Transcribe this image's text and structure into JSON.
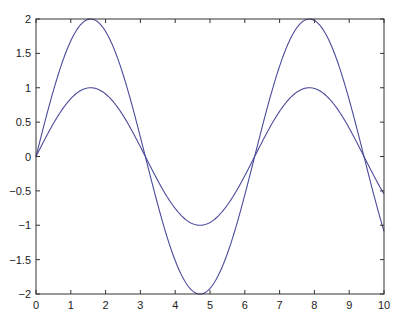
{
  "chart_data": {
    "type": "line",
    "title": "",
    "xlabel": "",
    "ylabel": "",
    "xlim": [
      0,
      10
    ],
    "ylim": [
      -2,
      2
    ],
    "grid": false,
    "legend": null,
    "x_ticks": [
      "0",
      "1",
      "2",
      "3",
      "4",
      "5",
      "6",
      "7",
      "8",
      "9",
      "10"
    ],
    "y_ticks": [
      "2",
      "1.5",
      "1",
      "0.5",
      "0",
      "-0.5",
      "-1",
      "-1.5",
      "-2"
    ],
    "line_color": "#4b4b9a",
    "series": [
      {
        "name": "sin(x)",
        "function": "sin",
        "amplitude": 1,
        "x": [
          0,
          0.5,
          1,
          1.5,
          2,
          2.5,
          3,
          3.5,
          4,
          4.5,
          5,
          5.5,
          6,
          6.5,
          7,
          7.5,
          8,
          8.5,
          9,
          9.5,
          10
        ],
        "values": [
          0,
          0.479,
          0.841,
          0.997,
          0.909,
          0.598,
          0.141,
          -0.351,
          -0.757,
          -0.978,
          -0.959,
          -0.706,
          -0.279,
          0.215,
          0.657,
          0.938,
          0.989,
          0.798,
          0.412,
          -0.075,
          -0.544
        ]
      },
      {
        "name": "2sin(x)",
        "function": "sin",
        "amplitude": 2,
        "x": [
          0,
          0.5,
          1,
          1.5,
          2,
          2.5,
          3,
          3.5,
          4,
          4.5,
          5,
          5.5,
          6,
          6.5,
          7,
          7.5,
          8,
          8.5,
          9,
          9.5,
          10
        ],
        "values": [
          0,
          0.959,
          1.683,
          1.995,
          1.819,
          1.197,
          0.282,
          -0.702,
          -1.514,
          -1.955,
          -1.918,
          -1.411,
          -0.559,
          0.43,
          1.314,
          1.876,
          1.979,
          1.596,
          0.824,
          -0.15,
          -1.088
        ]
      }
    ]
  }
}
